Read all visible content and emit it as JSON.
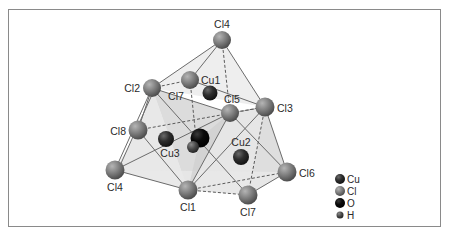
{
  "figure": {
    "title": "",
    "colors": {
      "frame": "#8a8a8a",
      "background": "#ffffff",
      "face_light": "#e4e4e4",
      "face_dark": "#cfcfcf",
      "bond_solid": "#6b6b6b",
      "bond_dashed": "#5a5a5a",
      "cl_sphere": "#7d7d7d",
      "cu_sphere": "#2e2e2e",
      "o_sphere": "#0a0a0a",
      "h_sphere": "#4a4a4a"
    }
  },
  "atoms": [
    {
      "id": "cl4_top",
      "element": "Cl",
      "label": "Cl4",
      "x": 222,
      "y": 40
    },
    {
      "id": "cl2",
      "element": "Cl",
      "label": "Cl2",
      "x": 152,
      "y": 88
    },
    {
      "id": "cl7_upper",
      "element": "Cl",
      "label": "Cl7",
      "x": 190,
      "y": 80
    },
    {
      "id": "cu1",
      "element": "Cu",
      "label": "Cu1",
      "x": 210,
      "y": 93
    },
    {
      "id": "cl5",
      "element": "Cl",
      "label": "Cl5",
      "x": 230,
      "y": 113
    },
    {
      "id": "cl3",
      "element": "Cl",
      "label": "Cl3",
      "x": 265,
      "y": 107
    },
    {
      "id": "cl8",
      "element": "Cl",
      "label": "Cl8",
      "x": 138,
      "y": 130
    },
    {
      "id": "cu3",
      "element": "Cu",
      "label": "Cu3",
      "x": 166,
      "y": 139
    },
    {
      "id": "o",
      "element": "O",
      "label": "",
      "x": 200,
      "y": 138
    },
    {
      "id": "h",
      "element": "H",
      "label": "",
      "x": 193,
      "y": 147
    },
    {
      "id": "cu2",
      "element": "Cu",
      "label": "Cu2",
      "x": 241,
      "y": 157
    },
    {
      "id": "cl4_low",
      "element": "Cl",
      "label": "Cl4",
      "x": 115,
      "y": 170
    },
    {
      "id": "cl6",
      "element": "Cl",
      "label": "Cl6",
      "x": 287,
      "y": 172
    },
    {
      "id": "cl1",
      "element": "Cl",
      "label": "Cl1",
      "x": 188,
      "y": 190
    },
    {
      "id": "cl7_bottom",
      "element": "Cl",
      "label": "Cl7",
      "x": 248,
      "y": 195
    }
  ],
  "labels": {
    "cl4_top": "Cl4",
    "cu1": "Cu1",
    "cl2": "Cl2",
    "cl7_upper": "Cl7",
    "cl5": "Cl5",
    "cl3": "Cl3",
    "cl8": "Cl8",
    "cu3": "Cu3",
    "cu2": "Cu2",
    "cl4_low": "Cl4",
    "cl6": "Cl6",
    "cl1": "Cl1",
    "cl7_bottom": "Cl7"
  },
  "legend": {
    "items": [
      {
        "element": "Cu",
        "label": "Cu",
        "color": "#2e2e2e"
      },
      {
        "element": "Cl",
        "label": "Cl",
        "color": "#7d7d7d"
      },
      {
        "element": "O",
        "label": "O",
        "color": "#0a0a0a"
      },
      {
        "element": "H",
        "label": "H",
        "color": "#4a4a4a"
      }
    ]
  }
}
